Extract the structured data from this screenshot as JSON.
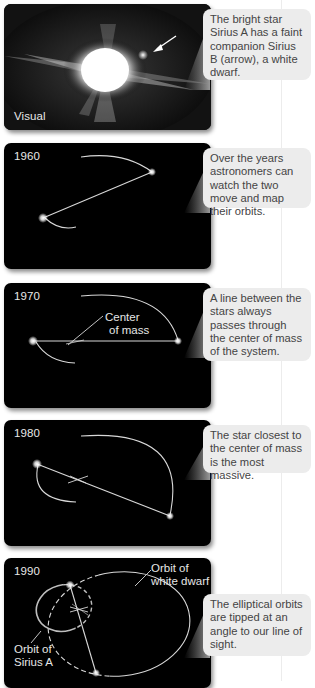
{
  "panels": [
    {
      "id": "visual",
      "label": "Visual",
      "caption": "The bright star Sirius A has a faint companion Sirius B (arrow), a white dwarf."
    },
    {
      "id": "1960",
      "label": "1960",
      "caption": "Over the years astronomers can watch the two move and map their orbits."
    },
    {
      "id": "1970",
      "label": "1970",
      "annotation": [
        "Center",
        "of mass"
      ],
      "caption": "A line between the stars always passes through the center of mass of the system."
    },
    {
      "id": "1980",
      "label": "1980",
      "caption": "The star closest to the center of mass is the most massive."
    },
    {
      "id": "1990",
      "label": "1990",
      "annotation_wd": [
        "Orbit of",
        "white dwarf"
      ],
      "annotation_a": [
        "Orbit of",
        "Sirius A"
      ],
      "caption": "The elliptical orbits are tipped at an angle to our line of sight."
    }
  ],
  "colors": {
    "panel_bg": "#000000",
    "callout_bg": "#ececec",
    "callout_text": "#444444",
    "orbit_line": "#d8d8d8"
  }
}
